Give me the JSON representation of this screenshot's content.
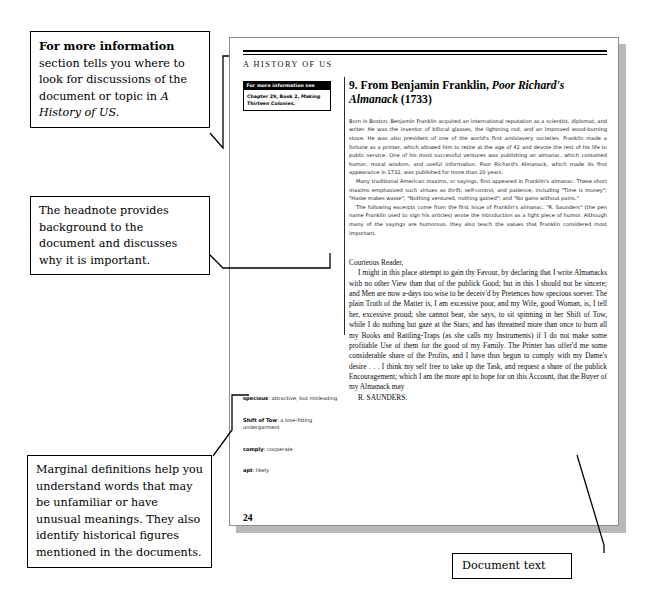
{
  "annotations": {
    "for_more_information": {
      "bold_lead": "For more information",
      "rest": " section tells you where to look for discussions of the document or topic in ",
      "italic_tail": "A History of US."
    },
    "headnote": "The headnote provides background to the document and discusses why it is important.",
    "marginal": "Marginal definitions help you understand words that may be unfamiliar or have unusual meanings. They also identify historical figures mentioned in the documents.",
    "document_text": "Document text"
  },
  "page": {
    "running_head": "A HISTORY OF US",
    "folio": "24",
    "for_more_information_box": {
      "header": "For more information see",
      "body_plain": "Chapter 29, Book 2, ",
      "body_italic": "Making Thirteen Colonies."
    },
    "title": {
      "prefix": "9. From Benjamin Franklin, ",
      "italic": "Poor Richard's Almanack",
      "suffix": " (1733)"
    },
    "headnote_paragraphs": [
      "Born in Boston, Benjamin Franklin acquired an international reputation as a scientist, diplomat, and writer. He was the inventor of bifocal glasses, the lightning rod, and an improved wood-burning stove. He was also president of one of the world's first antislavery societies. Franklin made a fortune as a printer, which allowed him to retire at the age of 42 and devote the rest of his life to public service. One of his most successful ventures was publishing an almanac, which contained humor, moral wisdom, and useful information. Poor Richard's Almanack, which made its first appearance in 1732, was published for more than 20 years.",
      "Many traditional American maxims, or sayings, first appeared in Franklin's almanac. These short maxims emphasized such virtues as thrift, self-control, and patience, including \"Time is money\"; \"Haste makes waste\"; \"Nothing ventured, nothing gained\"; and \"No gains without pains.\"",
      "The following excerpts come from the first issue of Franklin's almanac. \"R. Saunders\" (the pen name Franklin used to sign his articles) wrote the introduction as a light piece of humor. Although many of the sayings are humorous, they also teach the values that Franklin considered most important."
    ],
    "marginal_definitions": [
      {
        "term": "specious",
        "definition": ": attractive, but misleading"
      },
      {
        "term": "Shift of Tow",
        "definition": ": a lose-fitting undergarment"
      },
      {
        "term": "comply",
        "definition": ": cooperate"
      },
      {
        "term": "apt",
        "definition": ": likely"
      }
    ],
    "excerpt": {
      "salutation": "Courteous Reader,",
      "body": "I might in this place attempt to gain thy Favour, by declaring that I write Almanacks with no other View than that of the publick Good; but in this I should not be sincere; and Men are now a-days too wise to be deceiv'd by Pretences how specious soever. The plain Truth of the Matter is, I am excessive poor, and my Wife, good Woman, is, I tell her, excessive proud; she cannot bear, she says, to sit spinning in her Shift of Tow, while I do nothing but gaze at the Stars; and has threatned more than once to burn all my Books and Rattling-Traps (as she calls my Instruments) if I do not make some profitable Use of them for the good of my Family. The Printer has offer'd me some considerable share of the Profits, and I have thus begun to comply with my Dame's desire . . . I think my self free to take up the Task, and request a share of the publick Encouragement; which I am the more apt to hope for on this Account, that the Buyer of my Almanack may",
      "signature": "R. SAUNDERS."
    }
  }
}
